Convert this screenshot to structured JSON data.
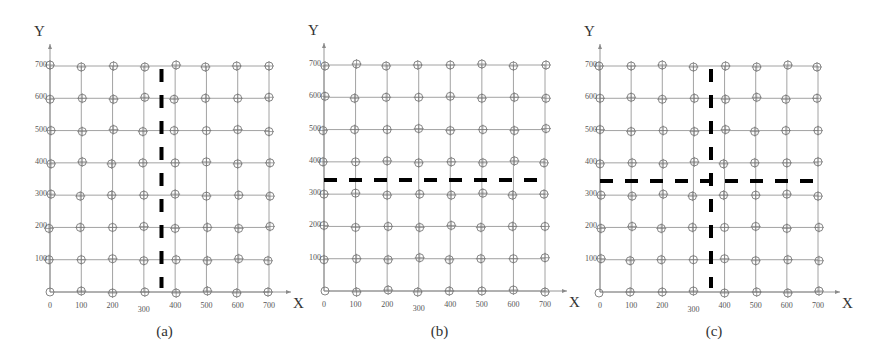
{
  "figure": {
    "panels": [
      {
        "id": "a",
        "caption": "(a)",
        "x_axis_label": "X",
        "y_axis_label": "Y",
        "x_ticks": [
          "0",
          "100",
          "200",
          "300",
          "400",
          "500",
          "600",
          "700"
        ],
        "y_ticks": [
          "100",
          "200",
          "300",
          "400",
          "500",
          "600",
          "700"
        ],
        "cut_lines": [
          {
            "orientation": "vertical",
            "value": 350
          }
        ]
      },
      {
        "id": "b",
        "caption": "(b)",
        "x_axis_label": "X",
        "y_axis_label": "Y",
        "x_ticks": [
          "0",
          "100",
          "200",
          "300",
          "400",
          "500",
          "600",
          "700"
        ],
        "y_ticks": [
          "100",
          "200",
          "300",
          "400",
          "500",
          "600",
          "700"
        ],
        "cut_lines": [
          {
            "orientation": "horizontal",
            "value": 350
          }
        ]
      },
      {
        "id": "c",
        "caption": "(c)",
        "x_axis_label": "X",
        "y_axis_label": "Y",
        "x_ticks": [
          "0",
          "100",
          "200",
          "300",
          "400",
          "500",
          "600",
          "700"
        ],
        "y_ticks": [
          "100",
          "200",
          "300",
          "400",
          "500",
          "600",
          "700"
        ],
        "cut_lines": [
          {
            "orientation": "vertical",
            "value": 350
          },
          {
            "orientation": "horizontal",
            "value": 350
          }
        ]
      }
    ],
    "grid": {
      "min": 0,
      "max": 700,
      "step": 100,
      "node_marker": "circle-with-crosshair"
    },
    "colors": {
      "grid_line": "#8a8a8a",
      "node": "#777777",
      "cut_line": "#000000",
      "text": "#333333"
    }
  }
}
